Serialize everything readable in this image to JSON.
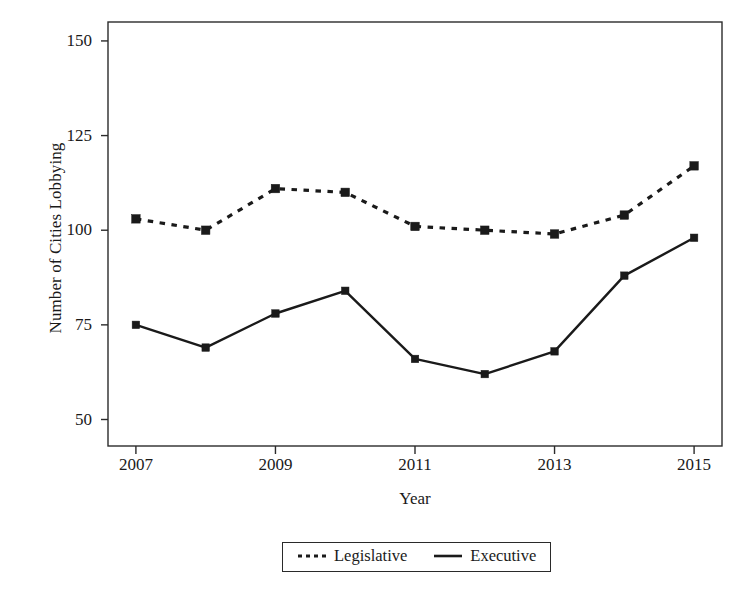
{
  "chart_data": {
    "type": "line",
    "title": "",
    "subtitle": "",
    "xlabel": "Year",
    "ylabel": "Number of Cities Lobbying",
    "x": [
      2007,
      2008,
      2009,
      2010,
      2011,
      2012,
      2013,
      2014,
      2015
    ],
    "xlim": [
      2006.6,
      2015.4
    ],
    "ylim": [
      43,
      155
    ],
    "xticks": [
      2007,
      2009,
      2011,
      2013,
      2015
    ],
    "xtick_labels": [
      "2007",
      "2009",
      "2011",
      "2013",
      "2015"
    ],
    "yticks": [
      50,
      75,
      100,
      125,
      150
    ],
    "ytick_labels": [
      "50",
      "75",
      "100",
      "125",
      "150"
    ],
    "grid": false,
    "legend_position": "below-center",
    "marker": "square",
    "series": [
      {
        "name": "Legislative",
        "style": "dashed",
        "color": "#1a1a1a",
        "values": [
          103,
          100,
          111,
          110,
          101,
          100,
          99,
          104,
          117
        ]
      },
      {
        "name": "Executive",
        "style": "solid",
        "color": "#1a1a1a",
        "values": [
          75,
          69,
          78,
          84,
          66,
          62,
          68,
          88,
          98
        ]
      }
    ]
  },
  "legend": {
    "items": [
      {
        "label": "Legislative",
        "style": "dashed"
      },
      {
        "label": "Executive",
        "style": "solid"
      }
    ]
  }
}
